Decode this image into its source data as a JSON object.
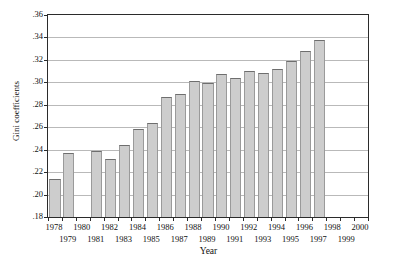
{
  "chart_data": {
    "type": "bar",
    "title": "",
    "xlabel": "Year",
    "ylabel": "Gini coefficients",
    "ylim": [
      0.18,
      0.36
    ],
    "ytick_labels": [
      ".18",
      ".20",
      ".22",
      ".24",
      ".26",
      ".28",
      ".30",
      ".32",
      ".34",
      ".36"
    ],
    "ytick_values": [
      0.18,
      0.2,
      0.22,
      0.24,
      0.26,
      0.28,
      0.3,
      0.32,
      0.34,
      0.36
    ],
    "grid": true,
    "legend": "none",
    "categories": [
      "1978",
      "1979",
      "1980",
      "1981",
      "1982",
      "1983",
      "1984",
      "1985",
      "1986",
      "1987",
      "1988",
      "1989",
      "1990",
      "1991",
      "1992",
      "1993",
      "1994",
      "1995",
      "1996",
      "1997",
      "1998",
      "1999",
      "2000"
    ],
    "values": [
      0.214,
      0.237,
      null,
      0.239,
      0.232,
      0.244,
      0.258,
      0.264,
      0.287,
      0.29,
      0.301,
      0.299,
      0.307,
      0.304,
      0.31,
      0.308,
      0.312,
      0.319,
      0.328,
      0.338,
      null,
      null,
      null
    ],
    "bars": [
      {
        "year": "1978",
        "value": 0.214
      },
      {
        "year": "1979",
        "value": 0.237
      },
      {
        "year": "1981",
        "value": 0.239
      },
      {
        "year": "1982",
        "value": 0.232
      },
      {
        "year": "1983",
        "value": 0.244
      },
      {
        "year": "1984",
        "value": 0.258
      },
      {
        "year": "1985",
        "value": 0.264
      },
      {
        "year": "1986",
        "value": 0.287
      },
      {
        "year": "1987",
        "value": 0.29
      },
      {
        "year": "1988",
        "value": 0.301
      },
      {
        "year": "1989",
        "value": 0.299
      },
      {
        "year": "1990",
        "value": 0.307
      },
      {
        "year": "1991",
        "value": 0.304
      },
      {
        "year": "1992",
        "value": 0.31
      },
      {
        "year": "1993",
        "value": 0.308
      },
      {
        "year": "1994",
        "value": 0.312
      },
      {
        "year": "1995",
        "value": 0.319
      },
      {
        "year": "1996",
        "value": 0.328
      },
      {
        "year": "1997",
        "value": 0.338
      }
    ],
    "xtick_labels": [
      {
        "label": "1978",
        "row": 0
      },
      {
        "label": "1979",
        "row": 1
      },
      {
        "label": "1980",
        "row": 0
      },
      {
        "label": "1981",
        "row": 1
      },
      {
        "label": "1982",
        "row": 0
      },
      {
        "label": "1983",
        "row": 1
      },
      {
        "label": "1984",
        "row": 0
      },
      {
        "label": "1985",
        "row": 1
      },
      {
        "label": "1986",
        "row": 0
      },
      {
        "label": "1987",
        "row": 1
      },
      {
        "label": "1988",
        "row": 0
      },
      {
        "label": "1989",
        "row": 1
      },
      {
        "label": "1990",
        "row": 0
      },
      {
        "label": "1991",
        "row": 1
      },
      {
        "label": "1992",
        "row": 0
      },
      {
        "label": "1993",
        "row": 1
      },
      {
        "label": "1994",
        "row": 0
      },
      {
        "label": "1995",
        "row": 1
      },
      {
        "label": "1996",
        "row": 0
      },
      {
        "label": "1997",
        "row": 1
      },
      {
        "label": "1998",
        "row": 0
      },
      {
        "label": "1999",
        "row": 1
      },
      {
        "label": "2000",
        "row": 0
      }
    ],
    "colors": {
      "bar_fill": "#cdcdcd",
      "bar_edge": "#6e6e6e",
      "axis": "#2b2b2b",
      "grid": "#b9b9b9",
      "background": "#ffffff"
    }
  }
}
